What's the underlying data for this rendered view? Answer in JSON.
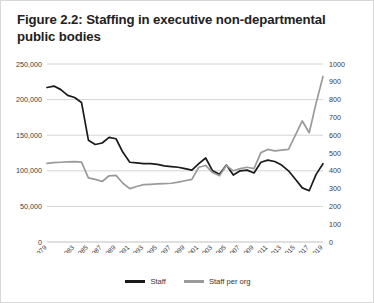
{
  "figure": {
    "title": "Figure 2.2: Staffing in executive non-departmental public bodies"
  },
  "legend": {
    "entries": [
      {
        "label": "Staff",
        "color": "#1a1a1a",
        "name": "legend-staff"
      },
      {
        "label": "Staff per org",
        "color": "#9a9a9a",
        "name": "legend-staff-per-org"
      }
    ]
  },
  "chart_data": {
    "type": "line",
    "title": "Figure 2.2: Staffing in executive non-departmental public bodies",
    "xlabel": "",
    "ylabel": "",
    "grid": true,
    "legend_position": "bottom",
    "x": [
      1979,
      1980,
      1981,
      1982,
      1983,
      1984,
      1985,
      1986,
      1987,
      1988,
      1989,
      1990,
      1991,
      1992,
      1993,
      1994,
      1995,
      1996,
      1997,
      1998,
      1999,
      2000,
      2001,
      2002,
      2003,
      2004,
      2005,
      2006,
      2007,
      2008,
      2009,
      2010,
      2011,
      2012,
      2013,
      2014,
      2015,
      2016,
      2017,
      2018,
      2019
    ],
    "xtick_labels": [
      "1979",
      "1983",
      "1985",
      "1987",
      "1989",
      "1991",
      "1993",
      "1995",
      "1997",
      "1999",
      "2001",
      "2003",
      "2005",
      "2007",
      "2009",
      "2011",
      "2013",
      "2015",
      "2017",
      "2019"
    ],
    "xticks_shown": [
      1979,
      1983,
      1985,
      1987,
      1989,
      1991,
      1993,
      1995,
      1997,
      1999,
      2001,
      2003,
      2005,
      2007,
      2009,
      2011,
      2013,
      2015,
      2017,
      2019
    ],
    "axes": [
      {
        "id": "left",
        "name": "staff-axis",
        "ylim": [
          0,
          250000
        ],
        "ticks": [
          0,
          50000,
          100000,
          150000,
          200000,
          250000
        ],
        "tick_labels": [
          "0",
          "50,000",
          "100,000",
          "150,000",
          "200,000",
          "250,000"
        ]
      },
      {
        "id": "right",
        "name": "staff-per-org-axis",
        "ylim": [
          0,
          1000
        ],
        "ticks": [
          0,
          100,
          200,
          300,
          400,
          500,
          600,
          700,
          800,
          900,
          1000
        ],
        "tick_labels": [
          "0",
          "100",
          "200",
          "300",
          "400",
          "500",
          "600",
          "700",
          "800",
          "900",
          "1000"
        ]
      }
    ],
    "series": [
      {
        "name": "Staff",
        "axis": "left",
        "color": "#1a1a1a",
        "values": [
          217000,
          219000,
          214000,
          206000,
          203000,
          196000,
          143000,
          137000,
          139000,
          147000,
          145000,
          126000,
          112000,
          111000,
          110000,
          110000,
          109000,
          107000,
          106000,
          105000,
          103000,
          101000,
          110000,
          118000,
          100000,
          95000,
          108000,
          94000,
          100000,
          101000,
          97000,
          112000,
          115000,
          113000,
          108000,
          100000,
          88000,
          76000,
          72000,
          95000,
          110000
        ]
      },
      {
        "name": "Staff per org",
        "axis": "right",
        "color": "#9a9a9a",
        "values": [
          442,
          446,
          448,
          450,
          452,
          449,
          360,
          352,
          340,
          372,
          374,
          330,
          300,
          312,
          322,
          324,
          326,
          328,
          330,
          336,
          344,
          352,
          420,
          430,
          390,
          372,
          430,
          400,
          412,
          420,
          412,
          502,
          520,
          512,
          516,
          520,
          600,
          680,
          614,
          780,
          930
        ]
      }
    ]
  }
}
